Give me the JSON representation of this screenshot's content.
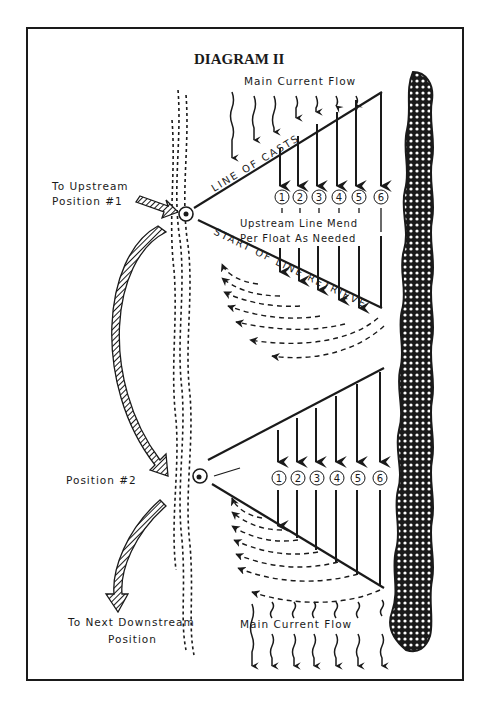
{
  "title": "DIAGRAM II",
  "labels": {
    "main_current_top": "Main Current Flow",
    "main_current_bottom": "Main Current Flow",
    "to_upstream_line1": "To Upstream",
    "to_upstream_line2": "Position #1",
    "position2": "Position #2",
    "to_next_line1": "To Next Downstream",
    "to_next_line2": "Position",
    "line_of_casts": "LINE OF CASTS",
    "start_of_line_retrieve": "START OF LINE RETRIEVE",
    "mend_line1": "Upstream Line Mend",
    "mend_line2": "Per Float As Needed"
  },
  "float_positions_top": [
    "1",
    "2",
    "3",
    "4",
    "5",
    "6"
  ],
  "float_positions_bottom": [
    "1",
    "2",
    "3",
    "4",
    "5",
    "6"
  ],
  "colors": {
    "ink": "#1a1a1a",
    "paper": "#ffffff"
  }
}
